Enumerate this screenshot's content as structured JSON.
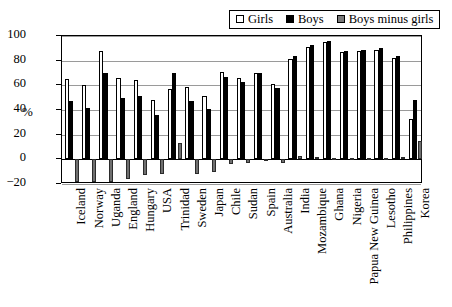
{
  "chart_data": {
    "type": "bar",
    "title": "",
    "subtitle": "",
    "xlabel": "",
    "ylabel": "%",
    "ylim": [
      -20,
      100
    ],
    "yticks": [
      -20,
      0,
      20,
      40,
      60,
      80,
      100
    ],
    "ytick_labels": [
      "−20",
      "0",
      "20",
      "40",
      "60",
      "80",
      "100"
    ],
    "grid": true,
    "legend_position": "top-right",
    "categories": [
      "Iceland",
      "Norway",
      "Uganda",
      "England",
      "Hungary",
      "USA",
      "Trinidad",
      "Sweden",
      "Japan",
      "Chile",
      "Sudan",
      "Spain",
      "Australia",
      "India",
      "Mozambique",
      "Ghana",
      "Nigeria",
      "Papua New Guinea",
      "Lesotho",
      "Philippines",
      "Korea"
    ],
    "series": [
      {
        "name": "Girls",
        "color": "#ffffff",
        "values": [
          65,
          60,
          88,
          66,
          64,
          48,
          57,
          59,
          51,
          71,
          66,
          70,
          61,
          81,
          91,
          95,
          87,
          88,
          89,
          82,
          33
        ]
      },
      {
        "name": "Boys",
        "color": "#000000",
        "values": [
          47,
          42,
          70,
          50,
          51,
          36,
          70,
          47,
          41,
          67,
          63,
          70,
          58,
          84,
          93,
          96,
          88,
          89,
          90,
          84,
          48
        ]
      },
      {
        "name": "Boys minus girls",
        "color": "#6f6f6f",
        "values": [
          -18,
          -18,
          -18,
          -16,
          -13,
          -12,
          13,
          -12,
          -10,
          -4,
          -3,
          0,
          -3,
          3,
          2,
          1,
          1,
          1,
          1,
          2,
          15
        ]
      }
    ]
  },
  "legend": {
    "items": [
      {
        "label": "Girls",
        "swatch": "girls-swatch"
      },
      {
        "label": "Boys",
        "swatch": "boys-swatch"
      },
      {
        "label": "Boys minus girls",
        "swatch": "diff-swatch"
      }
    ]
  }
}
